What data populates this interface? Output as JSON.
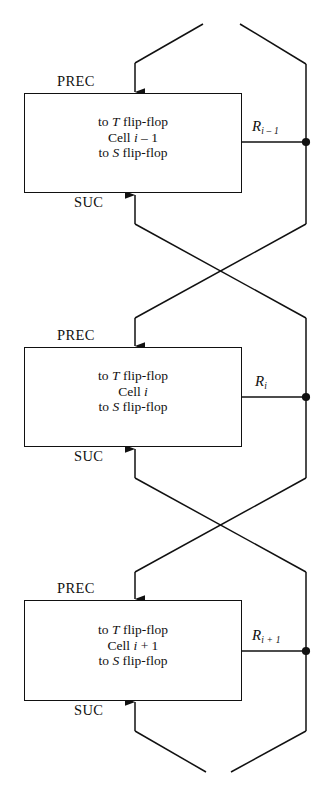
{
  "diagram": {
    "type": "block-diagram",
    "ink_color": "#111111",
    "background": "#ffffff",
    "port_labels": {
      "prec": "PREC",
      "suc": "SUC"
    },
    "cells": [
      {
        "id": "cell-i-minus-1",
        "line1": "to T flip-flop",
        "line1_pre": "to ",
        "line1_var": "T",
        "line1_post": " flip-flop",
        "line2_pre": "Cell ",
        "line2_var": "i",
        "line2_post": " – 1",
        "line3_pre": "to ",
        "line3_var": "S",
        "line3_post": " flip-flop",
        "prec": "PREC",
        "suc": "SUC",
        "output_label_base": "R",
        "output_label_sub": "i – 1"
      },
      {
        "id": "cell-i",
        "line1_pre": "to ",
        "line1_var": "T",
        "line1_post": " flip-flop",
        "line2_pre": "Cell ",
        "line2_var": "i",
        "line2_post": "",
        "line3_pre": "to ",
        "line3_var": "S",
        "line3_post": " flip-flop",
        "prec": "PREC",
        "suc": "SUC",
        "output_label_base": "R",
        "output_label_sub": "i"
      },
      {
        "id": "cell-i-plus-1",
        "line1_pre": "to ",
        "line1_var": "T",
        "line1_post": " flip-flop",
        "line2_pre": "Cell ",
        "line2_var": "i",
        "line2_post": " + 1",
        "line3_pre": "to ",
        "line3_var": "S",
        "line3_post": " flip-flop",
        "prec": "PREC",
        "suc": "SUC",
        "output_label_base": "R",
        "output_label_sub": "i + 1"
      }
    ]
  }
}
